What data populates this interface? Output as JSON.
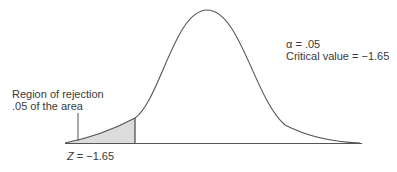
{
  "diagram": {
    "type": "normal-distribution-one-tailed-test",
    "tail": "left",
    "alpha_label": "α = .05",
    "critical_value_label": "Critical value = −1.65",
    "region_label_line1": "Region of rejection",
    "region_label_line2": ".05 of the area",
    "z_symbol": "Z",
    "z_value": " = −1.65",
    "colors": {
      "curve": "#555555",
      "shade": "#dcdcdc",
      "axis": "#555555"
    }
  }
}
